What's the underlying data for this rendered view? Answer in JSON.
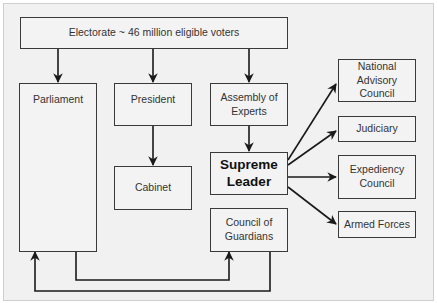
{
  "diagram": {
    "nodes": {
      "electorate": "Electorate  ~ 46 million eligible voters",
      "parliament": "Parliament",
      "president": "President",
      "cabinet": "Cabinet",
      "assembly": "Assembly of Experts",
      "supreme_leader": "Supreme Leader",
      "guardians": "Council of Guardians",
      "advisory": "National Advisory Council",
      "judiciary": "Judiciary",
      "expediency": "Expediency Council",
      "armed_forces": "Armed Forces"
    },
    "edges": [
      [
        "electorate",
        "parliament"
      ],
      [
        "electorate",
        "president"
      ],
      [
        "electorate",
        "assembly"
      ],
      [
        "president",
        "cabinet"
      ],
      [
        "assembly",
        "supreme_leader"
      ],
      [
        "supreme_leader",
        "advisory"
      ],
      [
        "supreme_leader",
        "judiciary"
      ],
      [
        "supreme_leader",
        "expediency"
      ],
      [
        "supreme_leader",
        "armed_forces"
      ],
      [
        "parliament",
        "guardians"
      ],
      [
        "guardians",
        "parliament"
      ]
    ],
    "colors": {
      "line": "#1a1a1a",
      "box_border": "#3a3a3a",
      "background": "#f1f1f1"
    }
  }
}
